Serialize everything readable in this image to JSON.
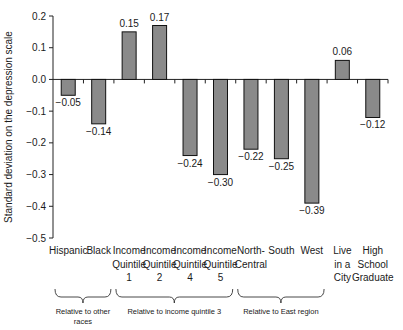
{
  "chart_data": {
    "type": "bar",
    "title": "",
    "xlabel": "",
    "ylabel": "Standard deviation on the depression scale",
    "ylim": [
      -0.5,
      0.2
    ],
    "yticks": [
      0.2,
      0.1,
      0.0,
      -0.1,
      -0.2,
      -0.3,
      -0.4,
      -0.5
    ],
    "ytick_labels": [
      "0.2",
      "0.1",
      "0.0",
      "−0.1",
      "−0.2",
      "−0.3",
      "−0.4",
      "−0.5"
    ],
    "grid": false,
    "categories": [
      "Hispanic",
      "Black",
      "Income Quintile 1",
      "Income Quintile 2",
      "Income Quintile 4",
      "Income Quintile 5",
      "North-Central",
      "South",
      "West",
      "Live in a City",
      "High School Graduate"
    ],
    "category_lines": [
      [
        "Hispanic"
      ],
      [
        "Black"
      ],
      [
        "Income",
        "Quintile",
        "1"
      ],
      [
        "Income",
        "Quintile",
        "2"
      ],
      [
        "Income",
        "Quintile",
        "4"
      ],
      [
        "Income",
        "Quintile",
        "5"
      ],
      [
        "North-",
        "Central"
      ],
      [
        "South"
      ],
      [
        "West"
      ],
      [
        "Live",
        "in a",
        "City"
      ],
      [
        "High",
        "School",
        "Graduate"
      ]
    ],
    "values": [
      -0.05,
      -0.14,
      0.15,
      0.17,
      -0.24,
      -0.3,
      -0.22,
      -0.25,
      -0.39,
      0.06,
      -0.12
    ],
    "value_labels": [
      "−0.05",
      "−0.14",
      "0.15",
      "0.17",
      "−0.24",
      "−0.30",
      "−0.22",
      "−0.25",
      "−0.39",
      "0.06",
      "−0.12"
    ],
    "groups": [
      {
        "label_lines": [
          "Relative to other",
          "races"
        ],
        "start": 0,
        "end": 1
      },
      {
        "label_lines": [
          "Relative to income quintile 3"
        ],
        "start": 2,
        "end": 5
      },
      {
        "label_lines": [
          "Relative to East region"
        ],
        "start": 6,
        "end": 8
      }
    ],
    "bar_color": "#8a8a8a",
    "bar_edge_color": "#111111"
  }
}
